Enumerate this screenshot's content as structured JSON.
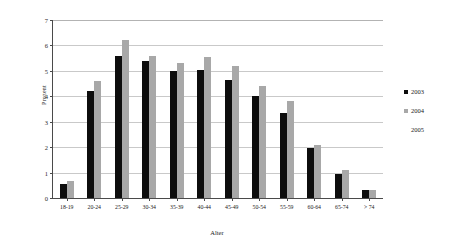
{
  "chart_data": {
    "type": "bar",
    "title": "",
    "xlabel": "Alter",
    "ylabel": "Prozent",
    "categories": [
      "18-19",
      "20-24",
      "25-29",
      "30-34",
      "35-39",
      "40-44",
      "45-49",
      "50-54",
      "55-59",
      "60-64",
      "65-74",
      "> 74"
    ],
    "series": [
      {
        "name": "2003",
        "color": "#0d0d0d",
        "values": [
          0.55,
          4.2,
          5.6,
          5.4,
          5.0,
          5.05,
          4.65,
          4.0,
          3.35,
          1.95,
          0.95,
          0.3
        ]
      },
      {
        "name": "2004",
        "color": "#a8a8a8",
        "values": [
          0.65,
          4.6,
          6.2,
          5.6,
          5.3,
          5.55,
          5.2,
          4.4,
          3.8,
          2.1,
          1.1,
          0.3
        ]
      },
      {
        "name": "2005",
        "color": "#ffffff",
        "values": [
          null,
          null,
          null,
          null,
          null,
          null,
          null,
          null,
          null,
          null,
          null,
          null
        ]
      }
    ],
    "ylim": [
      0,
      7
    ],
    "y_ticks": [
      0,
      1,
      2,
      3,
      4,
      5,
      6,
      7
    ],
    "y_tick_labels": [
      "0",
      "1",
      "2",
      "3",
      "4",
      "5",
      "6",
      "7"
    ],
    "grid": true,
    "grid_axis": "y",
    "legend_position": "right",
    "legend_entries": [
      "2003",
      "2004",
      "2005"
    ]
  },
  "legend": {
    "items": [
      {
        "label": "2003",
        "swatch": "filled-black-square-icon"
      },
      {
        "label": "2004",
        "swatch": "filled-gray-square-icon"
      },
      {
        "label": "2005",
        "swatch": "no-marker-icon"
      }
    ]
  },
  "axes": {
    "x_title": "Alter",
    "y_title": "Prozent"
  }
}
